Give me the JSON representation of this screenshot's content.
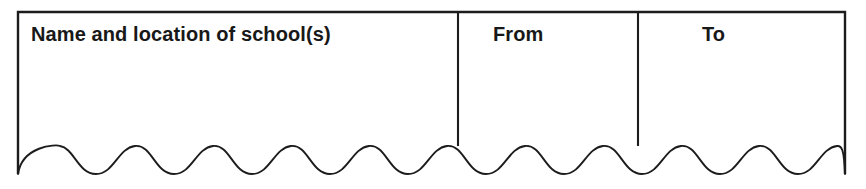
{
  "figure": {
    "kind": "blank-form-table-fragment",
    "background_color": "#ffffff",
    "line_color": "#1c1c1c"
  },
  "table": {
    "columns": [
      {
        "id": "school",
        "header": "Name and location of school(s)",
        "align": "left"
      },
      {
        "id": "from",
        "header": "From",
        "align": "left"
      },
      {
        "id": "to",
        "header": "To",
        "align": "left"
      }
    ],
    "rows": [],
    "bottom_edge": "scalloped-wave"
  }
}
